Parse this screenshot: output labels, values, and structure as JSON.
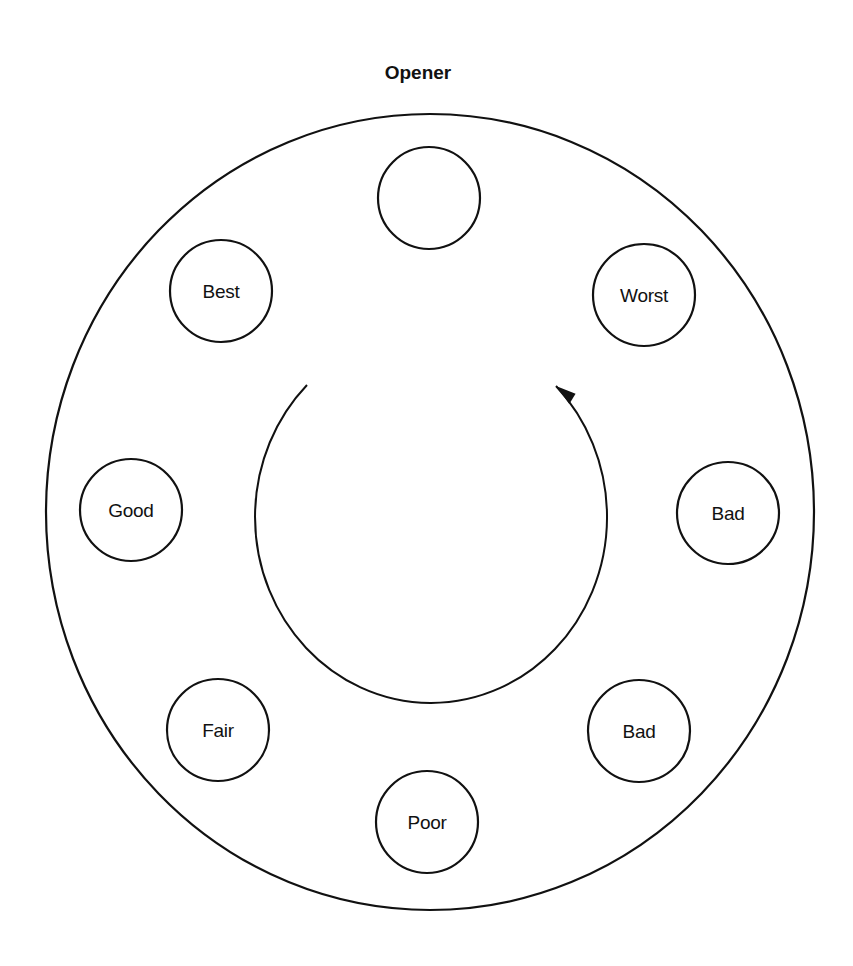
{
  "diagram": {
    "title": "Opener",
    "table": {
      "shape": "circle",
      "center": [
        430,
        512
      ],
      "radius_x": 384,
      "radius_y": 398
    },
    "seats": [
      {
        "position": "top",
        "label": "",
        "center": [
          429,
          198
        ]
      },
      {
        "position": "upper-right",
        "label": "Worst",
        "center": [
          644,
          295
        ]
      },
      {
        "position": "right",
        "label": "Bad",
        "center": [
          728,
          513
        ]
      },
      {
        "position": "lower-right",
        "label": "Bad",
        "center": [
          639,
          731
        ]
      },
      {
        "position": "bottom",
        "label": "Poor",
        "center": [
          427,
          822
        ]
      },
      {
        "position": "lower-left",
        "label": "Fair",
        "center": [
          218,
          730
        ]
      },
      {
        "position": "left",
        "label": "Good",
        "center": [
          131,
          510
        ]
      },
      {
        "position": "upper-left",
        "label": "Best",
        "center": [
          221,
          291
        ]
      }
    ],
    "seat_radius": 51,
    "flow_arrow": {
      "direction": "counter-clockwise",
      "start": [
        307,
        385
      ],
      "end": [
        556,
        386
      ],
      "description": "Curved arrow from upper-left around the bottom to upper-right"
    },
    "colors": {
      "stroke": "#111111",
      "background": "#ffffff"
    }
  }
}
